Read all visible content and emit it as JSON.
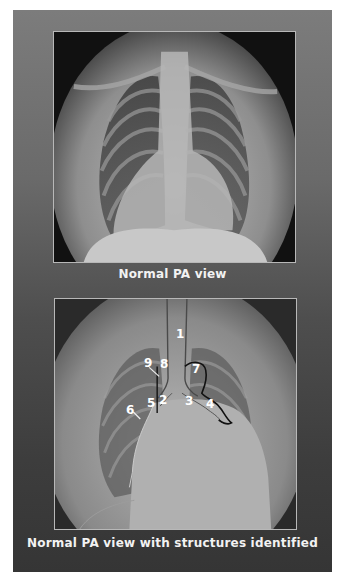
{
  "figure": {
    "background_colors": {
      "top": "#7c7c7c",
      "bottom": "#353535"
    },
    "panels": [
      {
        "caption": "Normal PA view"
      },
      {
        "caption": "Normal PA view with structures identified",
        "labels": [
          "1",
          "2",
          "3",
          "4",
          "5",
          "6",
          "7",
          "8",
          "9"
        ]
      }
    ]
  }
}
